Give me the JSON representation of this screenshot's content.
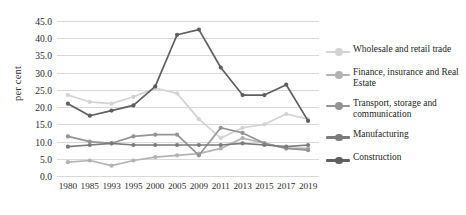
{
  "chart_data": {
    "type": "line",
    "title": "",
    "xlabel": "",
    "ylabel": "per cent",
    "ylim": [
      0,
      45
    ],
    "ytick_step": 5,
    "grid": true,
    "legend_position": "right",
    "categories": [
      "1980",
      "1985",
      "1993",
      "1995",
      "2000",
      "2005",
      "2009",
      "2011",
      "2013",
      "2015",
      "2017",
      "2019"
    ],
    "yticks": [
      "0.0",
      "5.0",
      "10.0",
      "15.0",
      "20.0",
      "25.0",
      "30.0",
      "35.0",
      "40.0",
      "45.0"
    ],
    "series": [
      {
        "name": "Wholesale and retail trade",
        "color": "#d3d3d3",
        "values": [
          23.5,
          21.5,
          21.0,
          23.0,
          25.5,
          24.0,
          16.5,
          11.0,
          14.0,
          15.0,
          18.0,
          16.5
        ]
      },
      {
        "name": "Finance, insurance and Real Estate",
        "color": "#b3b3b3",
        "values": [
          4.0,
          4.5,
          3.0,
          4.5,
          5.5,
          6.0,
          6.5,
          8.0,
          11.0,
          9.5,
          8.0,
          8.0
        ]
      },
      {
        "name": "Transport, storage and communication",
        "color": "#949494",
        "values": [
          11.5,
          10.0,
          9.5,
          11.5,
          12.0,
          12.0,
          6.0,
          14.0,
          12.5,
          9.5,
          8.0,
          7.5
        ]
      },
      {
        "name": "Manufacturing",
        "color": "#7b7b7b",
        "values": [
          8.5,
          9.0,
          9.5,
          9.0,
          9.0,
          9.0,
          9.0,
          9.0,
          9.5,
          9.0,
          8.5,
          9.0
        ]
      },
      {
        "name": "Construction",
        "color": "#5f5f5f",
        "values": [
          21.0,
          17.5,
          19.0,
          20.5,
          26.0,
          41.0,
          42.5,
          31.5,
          23.5,
          23.5,
          26.5,
          16.0
        ]
      }
    ]
  },
  "legend": {
    "items": [
      {
        "label": "Wholesale and retail trade"
      },
      {
        "label": "Finance, insurance and Real Estate"
      },
      {
        "label": "Transport, storage and communication"
      },
      {
        "label": "Manufacturing"
      },
      {
        "label": "Construction"
      }
    ]
  }
}
